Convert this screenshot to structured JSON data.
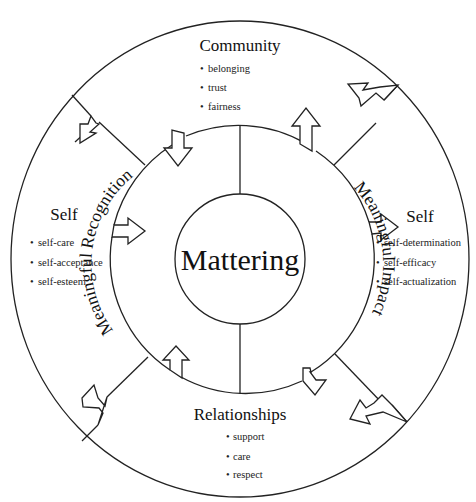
{
  "diagram": {
    "center": {
      "label": "Mattering"
    },
    "inner_ring": {
      "left": "Meaningful Recognition",
      "right": "Meaningful Impact"
    },
    "outer_sections": {
      "top": {
        "title": "Community",
        "items": [
          "belonging",
          "trust",
          "fairness"
        ]
      },
      "left": {
        "title": "Self",
        "items": [
          "self-care",
          "self-acceptance",
          "self-esteem"
        ]
      },
      "right": {
        "title": "Self",
        "items": [
          "self-determination",
          "self-efficacy",
          "self-actualization"
        ]
      },
      "bottom": {
        "title": "Relationships",
        "items": [
          "support",
          "care",
          "respect"
        ]
      }
    },
    "bullet": "•",
    "colors": {
      "stroke": "#222222",
      "background": "#ffffff",
      "text": "#111111"
    }
  }
}
